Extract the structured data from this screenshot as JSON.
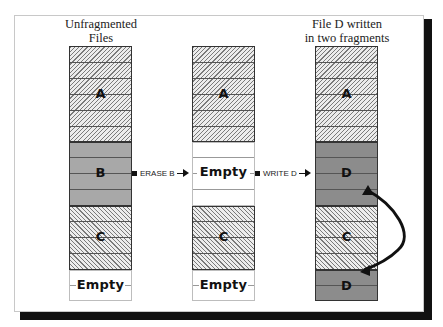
{
  "diagram": {
    "columns": [
      {
        "caption_lines": [
          "Unfragmented",
          "Files"
        ],
        "blocks": [
          {
            "label": "A",
            "rows": 6,
            "style": "hatched"
          },
          {
            "label": "B",
            "rows": 4,
            "style": "gray"
          },
          {
            "label": "C",
            "rows": 4,
            "style": "hatched"
          },
          {
            "label": "Empty",
            "rows": 2,
            "style": "empty"
          }
        ]
      },
      {
        "caption_lines": [],
        "blocks": [
          {
            "label": "A",
            "rows": 6,
            "style": "hatched"
          },
          {
            "label": "Empty",
            "rows": 4,
            "style": "empty"
          },
          {
            "label": "C",
            "rows": 4,
            "style": "hatched"
          },
          {
            "label": "Empty",
            "rows": 2,
            "style": "empty"
          }
        ]
      },
      {
        "caption_lines": [
          "File D written",
          "in two fragments"
        ],
        "blocks": [
          {
            "label": "A",
            "rows": 6,
            "style": "hatched"
          },
          {
            "label": "D",
            "rows": 4,
            "style": "dark"
          },
          {
            "label": "C",
            "rows": 4,
            "style": "hatched"
          },
          {
            "label": "D",
            "rows": 2,
            "style": "dark"
          }
        ]
      }
    ],
    "arrows": [
      {
        "label": "ERASE B",
        "from_column": 1,
        "to_column": 2
      },
      {
        "label": "WRITE D",
        "from_column": 2,
        "to_column": 3
      }
    ],
    "connector": {
      "description": "curved arrow linking first D fragment to second D fragment"
    },
    "colors": {
      "hatched_fill": "#ececec",
      "hatch_line": "#7a7a7a",
      "gray_block": "#a8a8a8",
      "dark_block": "#8c8c8c",
      "border": "#333333",
      "shadow": "#111111"
    }
  }
}
